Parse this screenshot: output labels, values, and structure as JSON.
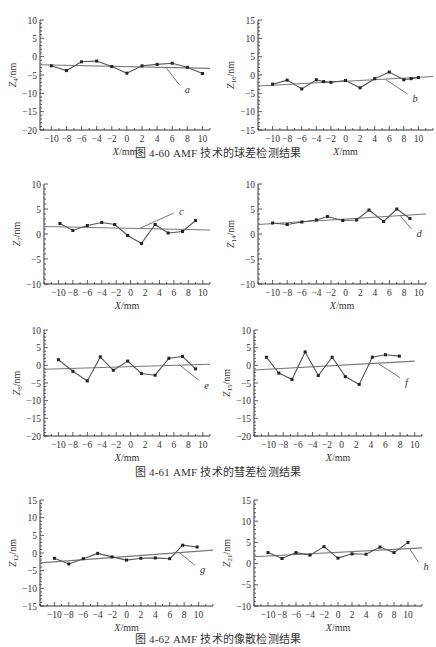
{
  "captions": {
    "fig60": "图 4-60   AMF 技术的球差检测结果",
    "fig61": "图 4-61   AMF 技术的彗差检测结果",
    "fig62": "图 4-62   AMF 技术的像散检测结果"
  },
  "chart_data": [
    {
      "id": "a",
      "type": "line",
      "figure": "4-60",
      "ylabel_main": "Z",
      "ylabel_sub": "4",
      "ylabel_unit": "/nm",
      "xlabel": "X/mm",
      "ylim": [
        -20,
        10
      ],
      "yticks": [
        10,
        5,
        0,
        -5,
        -10,
        -15,
        -20
      ],
      "xlim": [
        -11.5,
        11
      ],
      "xticks": [
        -10,
        -8,
        -6,
        -4,
        -2,
        0,
        2,
        4,
        6,
        8,
        10
      ],
      "annotation": "a",
      "series": [
        {
          "name": "measured",
          "x": [
            -10,
            -8,
            -6,
            -4,
            -2,
            0,
            2,
            4,
            6,
            8,
            10
          ],
          "values": [
            -2.5,
            -3.8,
            -1.4,
            -1.2,
            -2.7,
            -4.5,
            -2.5,
            -2.1,
            -1.8,
            -2.9,
            -4.6
          ]
        },
        {
          "name": "fit",
          "x": [
            -11.5,
            11
          ],
          "values": [
            -2.2,
            -3.2
          ]
        }
      ],
      "pointer": {
        "from": [
          5.2,
          -3.0
        ],
        "to": [
          7,
          -7.8
        ]
      }
    },
    {
      "id": "b",
      "type": "line",
      "figure": "4-60",
      "ylabel_main": "Z",
      "ylabel_sub": "16",
      "ylabel_unit": "/nm",
      "xlabel": "X/mm",
      "ylim": [
        -15,
        15
      ],
      "yticks": [
        15,
        10,
        5,
        0,
        -5,
        -10,
        -15
      ],
      "xlim": [
        -12,
        12
      ],
      "xticks": [
        -10,
        -8,
        -6,
        -4,
        -2,
        0,
        2,
        4,
        6,
        8,
        10
      ],
      "annotation": "b",
      "series": [
        {
          "name": "measured",
          "x": [
            -10,
            -8,
            -6,
            -4,
            -3,
            -2,
            0,
            2,
            4,
            6,
            8,
            9,
            10
          ],
          "values": [
            -2.5,
            -1.4,
            -3.8,
            -1.3,
            -1.8,
            -2.0,
            -1.5,
            -3.5,
            -1.0,
            0.8,
            -1.3,
            -1.0,
            -0.7
          ]
        },
        {
          "name": "fit",
          "x": [
            -12,
            12
          ],
          "values": [
            -3.0,
            -0.4
          ]
        }
      ],
      "pointer": {
        "from": [
          5.5,
          -1.2
        ],
        "to": [
          8.5,
          -5.2
        ]
      }
    },
    {
      "id": "c",
      "type": "line",
      "figure": "4-61",
      "ylabel_main": "Z",
      "ylabel_sub": "7",
      "ylabel_unit": "/nm",
      "xlabel": "X/mm",
      "ylim": [
        -10,
        10
      ],
      "yticks": [
        10,
        5,
        0,
        -5,
        -10
      ],
      "xlim": [
        -12,
        11
      ],
      "xticks": [
        -10,
        -8,
        -6,
        -4,
        -2,
        0,
        2,
        4,
        6,
        8,
        10
      ],
      "annotation": "c",
      "series": [
        {
          "name": "measured",
          "x": [
            -9.8,
            -8,
            -6,
            -4,
            -2.2,
            -0.4,
            1.5,
            3.4,
            5.2,
            7.2,
            9
          ],
          "values": [
            2.1,
            0.7,
            1.7,
            2.3,
            1.9,
            -0.3,
            -1.9,
            1.9,
            0.2,
            0.5,
            2.7
          ]
        },
        {
          "name": "fit",
          "x": [
            -12,
            11
          ],
          "values": [
            1.5,
            0.8
          ]
        }
      ],
      "pointer": {
        "from": [
          1.2,
          1.1
        ],
        "to": [
          6,
          4.2
        ]
      }
    },
    {
      "id": "d",
      "type": "line",
      "figure": "4-61",
      "ylabel_main": "Z",
      "ylabel_sub": "14",
      "ylabel_unit": "/nm",
      "xlabel": "X/mm",
      "ylim": [
        -10,
        10
      ],
      "yticks": [
        10,
        5,
        0,
        -5,
        -10
      ],
      "xlim": [
        -12,
        11
      ],
      "xticks": [
        -10,
        -8,
        -6,
        -4,
        -2,
        0,
        2,
        4,
        6,
        8,
        10
      ],
      "annotation": "d",
      "series": [
        {
          "name": "measured",
          "x": [
            -10,
            -8,
            -6,
            -4,
            -2.5,
            -0.4,
            1.5,
            3.2,
            5.2,
            7,
            8.8
          ],
          "values": [
            2.2,
            1.9,
            2.4,
            2.8,
            3.5,
            2.7,
            2.8,
            4.8,
            2.5,
            5.0,
            3.1
          ]
        },
        {
          "name": "fit",
          "x": [
            -12,
            11
          ],
          "values": [
            1.9,
            4.0
          ]
        }
      ],
      "pointer": {
        "from": [
          7.5,
          3.6
        ],
        "to": [
          9,
          1.0
        ]
      }
    },
    {
      "id": "e",
      "type": "line",
      "figure": "4-61",
      "ylabel_main": "Z",
      "ylabel_sub": "8",
      "ylabel_unit": "/nm",
      "xlabel": "X/mm",
      "ylim": [
        -20,
        10
      ],
      "yticks": [
        10,
        5,
        0,
        -5,
        -10,
        -15,
        -20
      ],
      "xlim": [
        -12,
        11
      ],
      "xticks": [
        -10,
        -8,
        -6,
        -4,
        -2,
        0,
        2,
        4,
        6,
        8,
        10
      ],
      "annotation": "e",
      "series": [
        {
          "name": "measured",
          "x": [
            -10,
            -8,
            -6,
            -4.2,
            -2.4,
            -0.4,
            1.5,
            3.4,
            5.3,
            7.2,
            9
          ],
          "values": [
            1.6,
            -1.7,
            -4.4,
            2.4,
            -1.4,
            1.2,
            -2.3,
            -2.8,
            2.0,
            2.5,
            -1.0
          ]
        },
        {
          "name": "fit",
          "x": [
            -12,
            11
          ],
          "values": [
            -1.1,
            0.3
          ]
        }
      ],
      "pointer": {
        "from": [
          6.8,
          0.1
        ],
        "to": [
          9.5,
          -4.3
        ]
      }
    },
    {
      "id": "f",
      "type": "line",
      "figure": "4-61",
      "ylabel_main": "Z",
      "ylabel_sub": "15",
      "ylabel_unit": "/nm",
      "xlabel": "X/mm",
      "ylim": [
        -20,
        10
      ],
      "yticks": [
        10,
        5,
        0,
        -5,
        -10,
        -15,
        -20
      ],
      "xlim": [
        -12,
        11
      ],
      "xticks": [
        -10,
        -8,
        -6,
        -4,
        -2,
        0,
        2,
        4,
        6,
        8,
        10
      ],
      "annotation": "f",
      "series": [
        {
          "name": "measured",
          "x": [
            -10.3,
            -8.6,
            -6.8,
            -5,
            -3.2,
            -1.3,
            0.5,
            2.4,
            4.2,
            6,
            7.9
          ],
          "values": [
            2.3,
            -2.2,
            -4.0,
            3.8,
            -2.9,
            2.3,
            -3.2,
            -5.4,
            2.3,
            3.0,
            2.6
          ]
        },
        {
          "name": "fit",
          "x": [
            -12,
            10
          ],
          "values": [
            -1.3,
            1.2
          ]
        }
      ],
      "pointer": {
        "from": [
          5,
          0.5
        ],
        "to": [
          8,
          -3.5
        ]
      }
    },
    {
      "id": "g",
      "type": "line",
      "figure": "4-62",
      "ylabel_main": "Z",
      "ylabel_sub": "12",
      "ylabel_unit": "/nm",
      "xlabel": "X/mm",
      "ylim": [
        -15,
        15
      ],
      "yticks": [
        15,
        10,
        5,
        0,
        -5,
        -10,
        -15
      ],
      "xlim": [
        -12,
        12
      ],
      "xticks": [
        -10,
        -8,
        -6,
        -4,
        -2,
        0,
        2,
        4,
        6,
        8,
        10
      ],
      "annotation": "g",
      "series": [
        {
          "name": "measured",
          "x": [
            -10,
            -8,
            -6,
            -4,
            -2,
            0,
            2,
            4,
            6,
            7.8,
            9.8
          ],
          "values": [
            -1.5,
            -3.1,
            -1.6,
            -0.1,
            -1.1,
            -2.0,
            -1.5,
            -1.4,
            -1.6,
            2.2,
            1.7
          ]
        },
        {
          "name": "fit",
          "x": [
            -12,
            12
          ],
          "values": [
            -2.8,
            0.8
          ]
        }
      ],
      "pointer": {
        "from": [
          7.3,
          0.2
        ],
        "to": [
          9.5,
          -3.5
        ]
      }
    },
    {
      "id": "h",
      "type": "line",
      "figure": "4-62",
      "ylabel_main": "Z",
      "ylabel_sub": "21",
      "ylabel_unit": "/nm",
      "xlabel": "X/mm",
      "ylim": [
        -10,
        15
      ],
      "yticks": [
        15,
        10,
        5,
        0,
        -5,
        -10
      ],
      "xlim": [
        -12,
        12
      ],
      "xticks": [
        -10,
        -8,
        -6,
        -4,
        -2,
        0,
        2,
        4,
        6,
        8,
        10
      ],
      "annotation": "h",
      "series": [
        {
          "name": "measured",
          "x": [
            -10,
            -8,
            -6,
            -4,
            -2,
            0,
            2,
            4,
            6,
            8,
            10
          ],
          "values": [
            2.6,
            1.2,
            2.6,
            2.0,
            4.0,
            1.3,
            2.3,
            2.2,
            3.9,
            2.6,
            5.0
          ]
        },
        {
          "name": "fit",
          "x": [
            -12,
            12
          ],
          "values": [
            1.6,
            3.7
          ]
        }
      ],
      "pointer": {
        "from": [
          10.2,
          3.6
        ],
        "to": [
          11.5,
          0.3
        ]
      }
    }
  ],
  "layout": {
    "charts": [
      {
        "id": "a",
        "left": 0,
        "top": 8,
        "plotX": 40,
        "plotY": 12,
        "plotW": 170,
        "plotH": 110
      },
      {
        "id": "b",
        "left": 218,
        "top": 8,
        "plotX": 40,
        "plotY": 12,
        "plotW": 175,
        "plotH": 110
      },
      {
        "id": "c",
        "left": 0,
        "top": 172,
        "plotX": 44,
        "plotY": 12,
        "plotW": 166,
        "plotH": 100
      },
      {
        "id": "d",
        "left": 218,
        "top": 172,
        "plotX": 40,
        "plotY": 12,
        "plotW": 168,
        "plotH": 100
      },
      {
        "id": "e",
        "left": 0,
        "top": 318,
        "plotX": 44,
        "plotY": 12,
        "plotW": 166,
        "plotH": 106
      },
      {
        "id": "f",
        "left": 218,
        "top": 318,
        "plotX": 36,
        "plotY": 12,
        "plotW": 168,
        "plotH": 106
      },
      {
        "id": "g",
        "left": 0,
        "top": 488,
        "plotX": 40,
        "plotY": 12,
        "plotW": 173,
        "plotH": 106
      },
      {
        "id": "h",
        "left": 218,
        "top": 488,
        "plotX": 36,
        "plotY": 12,
        "plotW": 168,
        "plotH": 106
      }
    ]
  },
  "colors": {
    "axis": "#333333",
    "line": "#555555",
    "fit": "#777777",
    "marker": "#222222",
    "text": "#333333"
  }
}
